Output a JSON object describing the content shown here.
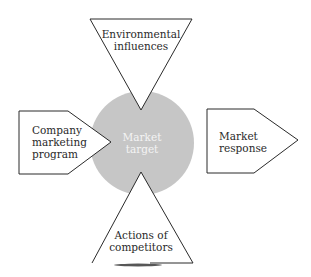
{
  "diagram": {
    "type": "market-influence-diagram",
    "center": {
      "label_line1": "Market",
      "label_line2": "target",
      "fill": "#c6c6c6"
    },
    "top": {
      "label_line1": "Environmental",
      "label_line2": "influences",
      "shape": "inverted-triangle"
    },
    "left": {
      "label_line1": "Company",
      "label_line2": "marketing",
      "label_line3": "program",
      "shape": "pentagon-arrow-right"
    },
    "right": {
      "label_line1": "Market",
      "label_line2": "response",
      "shape": "pentagon-arrow-right"
    },
    "bottom": {
      "label_line1": "Actions of",
      "label_line2": "competitors",
      "shape": "triangle"
    },
    "colors": {
      "stroke": "#2a2a2a",
      "background": "#ffffff",
      "circle": "#c6c6c6"
    }
  }
}
